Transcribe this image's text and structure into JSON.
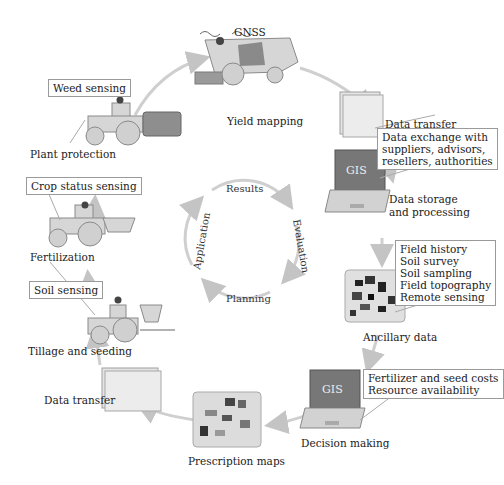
{
  "header_fragment": "",
  "stages": {
    "yield_mapping": {
      "label": "Yield mapping",
      "sensor": "GNSS"
    },
    "data_transfer_top": {
      "label": "Data transfer"
    },
    "data_storage": {
      "label_line1": "Data storage",
      "label_line2": "and processing",
      "screen_text": "GIS",
      "callout": "Data exchange with\nsuppliers, advisors,\nresellers, authorities"
    },
    "ancillary": {
      "label": "Ancillary data",
      "callout": "Field history\nSoil survey\nSoil sampling\nField topography\nRemote sensing"
    },
    "decision": {
      "label": "Decision making",
      "screen_text": "GIS",
      "callout": "Fertilizer and seed costs\nResource availability"
    },
    "prescription": {
      "label": "Prescription maps"
    },
    "data_transfer_bottom": {
      "label": "Data transfer"
    },
    "tillage": {
      "label": "Tillage and seeding",
      "callout": "Soil sensing"
    },
    "fertilization": {
      "label": "Fertilization",
      "callout": "Crop status sensing"
    },
    "plant_protection": {
      "label": "Plant protection",
      "callout": "Weed sensing"
    }
  },
  "inner_cycle": {
    "top": "Results",
    "right": "Evaluation",
    "bottom": "Planning",
    "left": "Application"
  },
  "colors": {
    "machine_fill": "#d6d6d6",
    "machine_stroke": "#8a8a8a",
    "tank_fill": "#9a9a9a",
    "laptop_screen": "#7a7a7a",
    "arrow": "#c8c8c8",
    "callout_border": "#9a9a9a"
  }
}
